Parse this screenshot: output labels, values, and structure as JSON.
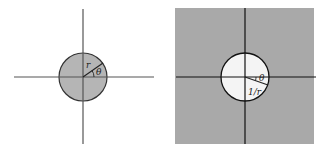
{
  "diagram": {
    "left_panel": {
      "description": "Disk of radius r (shaded interior) centered at origin",
      "labels": {
        "radius": "r",
        "angle": "θ"
      },
      "colors": {
        "disk_fill": "#b5b5b5",
        "background": "#ffffff",
        "stroke": "#333333"
      }
    },
    "right_panel": {
      "description": "Exterior of disk shaded; interior white; inverted radius",
      "labels": {
        "radius": "1/r",
        "angle": "θ"
      },
      "colors": {
        "exterior_fill": "#a9a9a9",
        "disk_fill": "#f4f4f4",
        "stroke": "#111111"
      }
    }
  }
}
